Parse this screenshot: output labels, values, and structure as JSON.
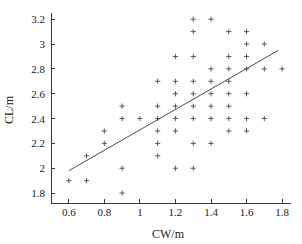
{
  "chart_data": {
    "type": "scatter",
    "title": "",
    "xlabel": "CW/m",
    "ylabel": "CL/m",
    "xlim": [
      0.5,
      1.85
    ],
    "ylim": [
      1.72,
      3.25
    ],
    "xticks": [
      0.6,
      0.8,
      1,
      1.2,
      1.4,
      1.6,
      1.8
    ],
    "xtick_labels": [
      "0.6",
      "0.8",
      "1",
      "1.2",
      "1.4",
      "1.6",
      "1.8"
    ],
    "yticks": [
      1.8,
      2,
      2.2,
      2.4,
      2.6,
      2.8,
      3,
      3.2
    ],
    "ytick_labels": [
      "1.8",
      "2",
      "2.2",
      "2.4",
      "2.6",
      "2.8",
      "3",
      "3.2"
    ],
    "grid": false,
    "legend": null,
    "marker": "plus",
    "marker_color": "#4a4a4a",
    "series": [
      {
        "name": "samples",
        "points": [
          [
            0.6,
            1.9
          ],
          [
            0.7,
            1.9
          ],
          [
            0.7,
            2.1
          ],
          [
            0.8,
            2.2
          ],
          [
            0.8,
            2.3
          ],
          [
            0.9,
            1.8
          ],
          [
            0.9,
            2.0
          ],
          [
            0.9,
            2.4
          ],
          [
            0.9,
            2.5
          ],
          [
            1.0,
            2.4
          ],
          [
            1.1,
            2.1
          ],
          [
            1.1,
            2.2
          ],
          [
            1.1,
            2.3
          ],
          [
            1.1,
            2.4
          ],
          [
            1.1,
            2.5
          ],
          [
            1.1,
            2.7
          ],
          [
            1.2,
            2.0
          ],
          [
            1.2,
            2.3
          ],
          [
            1.2,
            2.4
          ],
          [
            1.2,
            2.5
          ],
          [
            1.2,
            2.6
          ],
          [
            1.2,
            2.7
          ],
          [
            1.2,
            2.9
          ],
          [
            1.3,
            2.0
          ],
          [
            1.3,
            2.2
          ],
          [
            1.3,
            2.4
          ],
          [
            1.3,
            2.5
          ],
          [
            1.3,
            2.6
          ],
          [
            1.3,
            2.7
          ],
          [
            1.3,
            2.9
          ],
          [
            1.3,
            3.1
          ],
          [
            1.3,
            3.2
          ],
          [
            1.4,
            2.2
          ],
          [
            1.4,
            2.4
          ],
          [
            1.4,
            2.5
          ],
          [
            1.4,
            2.6
          ],
          [
            1.4,
            2.7
          ],
          [
            1.4,
            2.8
          ],
          [
            1.4,
            3.2
          ],
          [
            1.5,
            2.3
          ],
          [
            1.5,
            2.4
          ],
          [
            1.5,
            2.5
          ],
          [
            1.5,
            2.6
          ],
          [
            1.5,
            2.7
          ],
          [
            1.5,
            2.8
          ],
          [
            1.5,
            2.9
          ],
          [
            1.5,
            3.1
          ],
          [
            1.6,
            2.3
          ],
          [
            1.6,
            2.4
          ],
          [
            1.6,
            2.6
          ],
          [
            1.6,
            2.8
          ],
          [
            1.6,
            2.9
          ],
          [
            1.6,
            3.0
          ],
          [
            1.6,
            3.1
          ],
          [
            1.7,
            2.4
          ],
          [
            1.7,
            2.8
          ],
          [
            1.7,
            3.0
          ],
          [
            1.8,
            2.8
          ]
        ]
      }
    ],
    "fit_line": {
      "name": "regression-line",
      "x_start": 0.6,
      "y_start": 1.98,
      "x_end": 1.78,
      "y_end": 2.95,
      "color": "#4a4a4a"
    }
  }
}
